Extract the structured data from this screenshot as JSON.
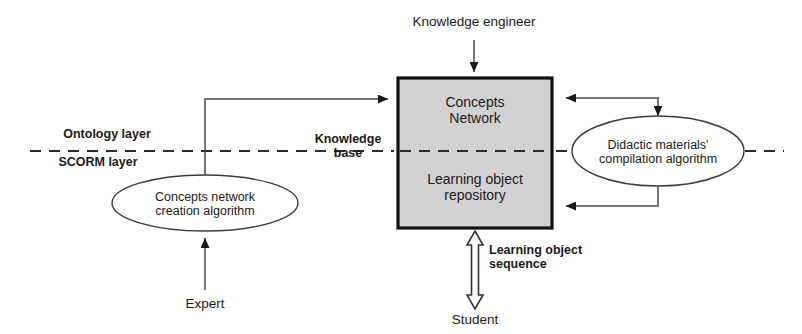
{
  "diagram": {
    "colors": {
      "stroke": "#1a1a1a",
      "line": "#555555",
      "box_fill": "#d2d2d2",
      "box_border": "#111111",
      "ellipse_fill": "#ffffff",
      "text": "#1a1a1a",
      "background": "#ffffff"
    },
    "layers": [
      {
        "name": "layer-ontology",
        "label": "Ontology layer",
        "position": "above-divider"
      },
      {
        "name": "layer-scorm",
        "label": "SCORM layer",
        "position": "below-divider"
      }
    ],
    "divider": {
      "style": "dashed",
      "label": "layer-divider"
    },
    "nodes": [
      {
        "id": "concepts-network",
        "label": "Concepts\nNetwork",
        "shape": "rectangle-top-half",
        "fill": "#d2d2d2"
      },
      {
        "id": "learning-object-repository",
        "label": "Learning object\nrepository",
        "shape": "rectangle-bottom-half",
        "fill": "#d2d2d2"
      },
      {
        "id": "concepts-network-creation-algorithm",
        "label": "Concepts network\ncreation algorithm",
        "shape": "ellipse",
        "fill": "#ffffff"
      },
      {
        "id": "didactic-materials-compilation-algorithm",
        "label": "Didactic materials'\ncompilation algorithm",
        "shape": "ellipse",
        "fill": "#ffffff"
      }
    ],
    "actors": [
      {
        "id": "knowledge-engineer",
        "label": "Knowledge engineer",
        "position": "top"
      },
      {
        "id": "expert",
        "label": "Expert",
        "position": "bottom-left"
      },
      {
        "id": "student",
        "label": "Student",
        "position": "bottom-center"
      }
    ],
    "edge_labels": [
      {
        "id": "knowledge-base",
        "label": "Knowledge\nbase"
      },
      {
        "id": "learning-object-sequence",
        "label": "Learning object\nsequence"
      }
    ],
    "edges": [
      {
        "from": "knowledge-engineer",
        "to": "concepts-network",
        "arrow": "single"
      },
      {
        "from": "concepts-network-creation-algorithm",
        "to": "concepts-network",
        "arrow": "single"
      },
      {
        "from": "expert",
        "to": "concepts-network-creation-algorithm",
        "arrow": "single"
      },
      {
        "from": "concepts-network",
        "to": "didactic-materials-compilation-algorithm",
        "arrow": "single"
      },
      {
        "from": "didactic-materials-compilation-algorithm",
        "to": "concepts-network",
        "arrow": "single"
      },
      {
        "from": "didactic-materials-compilation-algorithm",
        "to": "learning-object-repository",
        "arrow": "single"
      },
      {
        "from": "learning-object-repository",
        "to": "student",
        "arrow": "double-hollow",
        "label": "learning-object-sequence"
      }
    ]
  }
}
